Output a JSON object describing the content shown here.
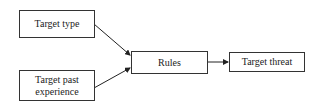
{
  "diagram": {
    "nodes": [
      {
        "id": "target_type",
        "label": "Target type"
      },
      {
        "id": "target_past_experience",
        "label": "Target past experience",
        "label_lines": [
          "Target past",
          "experience"
        ]
      },
      {
        "id": "rules",
        "label": "Rules"
      },
      {
        "id": "target_threat",
        "label": "Target threat"
      }
    ],
    "edges": [
      {
        "from": "target_type",
        "to": "rules"
      },
      {
        "from": "target_past_experience",
        "to": "rules"
      },
      {
        "from": "rules",
        "to": "target_threat"
      }
    ]
  }
}
